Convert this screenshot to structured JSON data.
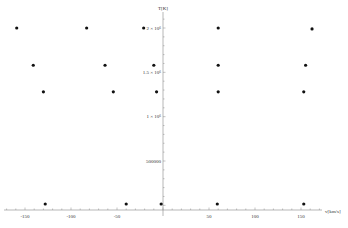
{
  "chart_data": {
    "type": "scatter",
    "title": "",
    "xlabel": "v[km/s]",
    "ylabel": "T[K]",
    "xlim": [
      -165,
      165
    ],
    "ylim": [
      0,
      2100000
    ],
    "grid": false,
    "legend": null,
    "x_ticks": [
      -150,
      -100,
      -50,
      50,
      100,
      150
    ],
    "x_tick_labels": [
      "-150",
      "-100",
      "-50",
      "50",
      "100",
      "150"
    ],
    "y_ticks": [
      500000,
      1000000,
      1500000,
      2000000
    ],
    "y_tick_labels": [
      "500000",
      "1 × 10⁶",
      "1.5 × 10⁶",
      "2 × 10⁶"
    ],
    "series": [
      {
        "name": "points",
        "color": "#111111",
        "points": [
          {
            "x": -159,
            "y": 2000000
          },
          {
            "x": -83,
            "y": 2000000
          },
          {
            "x": -21,
            "y": 2000000
          },
          {
            "x": 60,
            "y": 2000000
          },
          {
            "x": 162,
            "y": 1990000
          },
          {
            "x": -141,
            "y": 1580000
          },
          {
            "x": -63,
            "y": 1580000
          },
          {
            "x": -10,
            "y": 1580000
          },
          {
            "x": 60,
            "y": 1580000
          },
          {
            "x": 155,
            "y": 1580000
          },
          {
            "x": -130,
            "y": 1280000
          },
          {
            "x": -54,
            "y": 1280000
          },
          {
            "x": -7,
            "y": 1280000
          },
          {
            "x": 60,
            "y": 1280000
          },
          {
            "x": 153,
            "y": 1280000
          },
          {
            "x": -128,
            "y": 10000
          },
          {
            "x": -40,
            "y": 10000
          },
          {
            "x": -2,
            "y": 10000
          },
          {
            "x": 59,
            "y": 10000
          },
          {
            "x": 153,
            "y": 10000
          }
        ]
      }
    ]
  }
}
